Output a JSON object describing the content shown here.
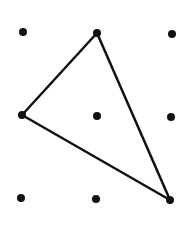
{
  "diagram": {
    "type": "dot-grid-triangle",
    "background": "#ffffff",
    "ink_color": "#111111",
    "grid": {
      "rows": 3,
      "cols": 3,
      "dots": [
        {
          "id": "r1c1",
          "x": 23,
          "y": 32
        },
        {
          "id": "r1c2",
          "x": 97,
          "y": 33
        },
        {
          "id": "r1c3",
          "x": 172,
          "y": 34
        },
        {
          "id": "r2c1",
          "x": 22,
          "y": 115
        },
        {
          "id": "r2c2",
          "x": 97,
          "y": 116
        },
        {
          "id": "r2c3",
          "x": 171,
          "y": 117
        },
        {
          "id": "r3c1",
          "x": 21,
          "y": 198
        },
        {
          "id": "r3c2",
          "x": 96,
          "y": 199
        },
        {
          "id": "r3c3",
          "x": 170,
          "y": 200
        }
      ],
      "dot_radius": 4
    },
    "triangle": {
      "vertices": [
        {
          "ref": "r1c2",
          "x": 97,
          "y": 33
        },
        {
          "ref": "r2c1",
          "x": 22,
          "y": 115
        },
        {
          "ref": "r3c3",
          "x": 170,
          "y": 200
        }
      ],
      "stroke_width": 2.5
    }
  }
}
